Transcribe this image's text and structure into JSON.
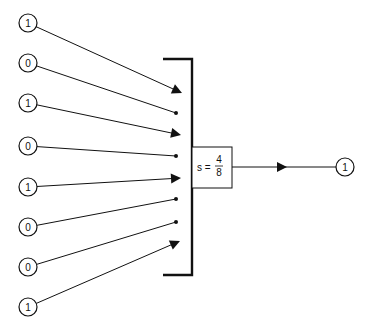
{
  "diagram": {
    "inputs": [
      {
        "label": "1",
        "cx": 28,
        "cy": 23,
        "end_x": 182,
        "end_y": 93,
        "terminator": "arrow"
      },
      {
        "label": "0",
        "cx": 28,
        "cy": 63,
        "end_x": 176,
        "end_y": 113,
        "terminator": "dot"
      },
      {
        "label": "1",
        "cx": 28,
        "cy": 103,
        "end_x": 181,
        "end_y": 135,
        "terminator": "arrow"
      },
      {
        "label": "0",
        "cx": 28,
        "cy": 146,
        "end_x": 176,
        "end_y": 156,
        "terminator": "dot"
      },
      {
        "label": "1",
        "cx": 28,
        "cy": 187,
        "end_x": 181,
        "end_y": 178,
        "terminator": "arrow"
      },
      {
        "label": "0",
        "cx": 28,
        "cy": 227,
        "end_x": 176,
        "end_y": 199,
        "terminator": "dot"
      },
      {
        "label": "0",
        "cx": 28,
        "cy": 267,
        "end_x": 176,
        "end_y": 222,
        "terminator": "dot"
      },
      {
        "label": "1",
        "cx": 28,
        "cy": 307,
        "end_x": 180,
        "end_y": 241,
        "terminator": "arrow"
      }
    ],
    "summation_box": {
      "lhs": "s =",
      "numerator": "4",
      "denominator": "8"
    },
    "output": {
      "label": "1"
    }
  }
}
